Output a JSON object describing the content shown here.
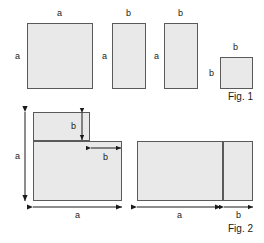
{
  "figure": {
    "fill_color": "#e9e9e9",
    "stroke_color": "#5a5a5a",
    "text_color": "#1a1a1a",
    "background_color": "#ffffff"
  },
  "fig1": {
    "caption": "Fig. 1",
    "shapes": [
      {
        "name": "square-a-by-a",
        "top_label": "a",
        "left_label": "a",
        "x": 27,
        "y": 23,
        "w": 66,
        "h": 66
      },
      {
        "name": "rectangle-a-by-b-first",
        "top_label": "b",
        "left_label": "a",
        "x": 112,
        "y": 23,
        "w": 34,
        "h": 66
      },
      {
        "name": "rectangle-a-by-b-second",
        "top_label": "b",
        "left_label": "a",
        "x": 164,
        "y": 23,
        "w": 34,
        "h": 66
      },
      {
        "name": "square-b-by-b",
        "top_label": "b",
        "left_label": "b",
        "x": 220,
        "y": 57,
        "w": 33,
        "h": 32
      }
    ]
  },
  "fig2": {
    "caption": "Fig. 2",
    "left_assembly": {
      "name": "l-shaped-assembly",
      "upper_rect": {
        "x": 33,
        "y": 112,
        "w": 57,
        "h": 29
      },
      "lower_rect": {
        "x": 33,
        "y": 141,
        "w": 89,
        "h": 60
      },
      "dim_height_label": "a",
      "dim_width_label": "a",
      "dim_inner_vertical_label": "b",
      "dim_inner_horizontal_label": "b"
    },
    "right_assembly": {
      "name": "split-rectangle-assembly",
      "rect": {
        "x": 137,
        "y": 141,
        "w": 116,
        "h": 60
      },
      "divider_x": 222,
      "dim_main_label": "a",
      "dim_strip_label": "b"
    }
  }
}
